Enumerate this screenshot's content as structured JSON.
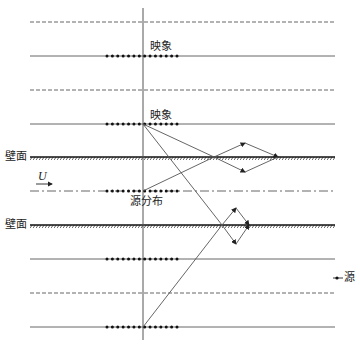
{
  "labels": {
    "image_top": "映象",
    "image_mid": "映象",
    "wall_upper": "壁面",
    "wall_lower": "壁面",
    "flow_velocity": "U",
    "source_distribution": "源分布",
    "legend_source": "源"
  },
  "geometry": {
    "axis_x": 143,
    "line_x_start": 30,
    "line_x_end": 335,
    "dots_x_start": 107,
    "dots_x_end": 177,
    "dot_count": 14,
    "horizontal_lines": [
      {
        "y": 22,
        "style": "dashed",
        "dots": false
      },
      {
        "y": 56,
        "style": "solid",
        "dots": true
      },
      {
        "y": 90,
        "style": "dashed",
        "dots": false
      },
      {
        "y": 124,
        "style": "solid",
        "dots": true
      },
      {
        "y": 157,
        "style": "wall",
        "dots": false
      },
      {
        "y": 191,
        "style": "dashdot",
        "dots": true
      },
      {
        "y": 225,
        "style": "wall",
        "dots": false
      },
      {
        "y": 259,
        "style": "solid",
        "dots": true
      },
      {
        "y": 293,
        "style": "dashed",
        "dots": false
      },
      {
        "y": 327,
        "style": "solid",
        "dots": true
      }
    ]
  },
  "colors": {
    "line": "#555555",
    "wall": "#111111",
    "dot": "#111111",
    "text": "#222222"
  }
}
